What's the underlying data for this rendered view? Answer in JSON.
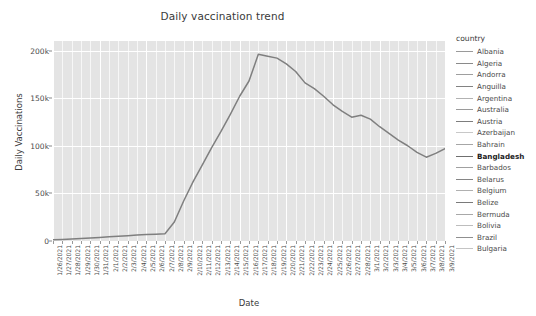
{
  "chart_data": {
    "type": "line",
    "title": "Daily vaccination trend",
    "xlabel": "Date",
    "ylabel": "Daily Vaccinations",
    "grid": true,
    "legend_position": "right",
    "legend_title": "country",
    "highlighted_series": "Bangladesh",
    "ylim": [
      0,
      210000
    ],
    "yticks": [
      0,
      50000,
      100000,
      150000,
      200000
    ],
    "ytick_labels": [
      "0",
      "50k",
      "100k",
      "150k",
      "200k"
    ],
    "x": [
      "1/26/2021",
      "1/27/2021",
      "1/28/2021",
      "1/29/2021",
      "1/30/2021",
      "1/31/2021",
      "2/1/2021",
      "2/2/2021",
      "2/3/2021",
      "2/4/2021",
      "2/5/2021",
      "2/6/2021",
      "2/7/2021",
      "2/8/2021",
      "2/9/2021",
      "2/10/2021",
      "2/11/2021",
      "2/12/2021",
      "2/13/2021",
      "2/14/2021",
      "2/15/2021",
      "2/16/2021",
      "2/17/2021",
      "2/18/2021",
      "2/19/2021",
      "2/20/2021",
      "2/21/2021",
      "2/22/2021",
      "2/23/2021",
      "2/24/2021",
      "2/25/2021",
      "2/26/2021",
      "2/27/2021",
      "2/28/2021",
      "3/1/2021",
      "3/2/2021",
      "3/3/2021",
      "3/4/2021",
      "3/5/2021",
      "3/6/2021",
      "3/7/2021",
      "3/8/2021",
      "3/9/2021"
    ],
    "series": [
      {
        "name": "Bangladesh",
        "color": "#7f7f7f",
        "values": [
          1200,
          1500,
          2000,
          2600,
          3200,
          3800,
          4400,
          5000,
          5600,
          6200,
          6800,
          7200,
          7600,
          20000,
          42000,
          62000,
          80000,
          98000,
          115000,
          133000,
          152000,
          168000,
          196000,
          194000,
          192000,
          186000,
          178000,
          166000,
          160000,
          152000,
          143000,
          136000,
          130000,
          132000,
          128000,
          120000,
          113000,
          106000,
          100000,
          93000,
          88000,
          92000,
          97000
        ]
      }
    ],
    "legend_entries": [
      {
        "label": "Albania",
        "color": "#9a9a9a"
      },
      {
        "label": "Algeria",
        "color": "#8a8a8a"
      },
      {
        "label": "Andorra",
        "color": "#9e9e9e"
      },
      {
        "label": "Anguilla",
        "color": "#828282"
      },
      {
        "label": "Argentina",
        "color": "#b2b2b2"
      },
      {
        "label": "Australia",
        "color": "#9a9a9a"
      },
      {
        "label": "Austria",
        "color": "#7d7d7d"
      },
      {
        "label": "Azerbaijan",
        "color": "#c8c8c8"
      },
      {
        "label": "Bahrain",
        "color": "#a6a6a6"
      },
      {
        "label": "Bangladesh",
        "color": "#6f6f6f"
      },
      {
        "label": "Barbados",
        "color": "#a0a0a0"
      },
      {
        "label": "Belarus",
        "color": "#858585"
      },
      {
        "label": "Belgium",
        "color": "#b0b0b0"
      },
      {
        "label": "Belize",
        "color": "#7a7a7a"
      },
      {
        "label": "Bermuda",
        "color": "#a8a8a8"
      },
      {
        "label": "Bolivia",
        "color": "#bdbdbd"
      },
      {
        "label": "Brazil",
        "color": "#8f8f8f"
      },
      {
        "label": "Bulgaria",
        "color": "#c4c4c4"
      }
    ]
  }
}
